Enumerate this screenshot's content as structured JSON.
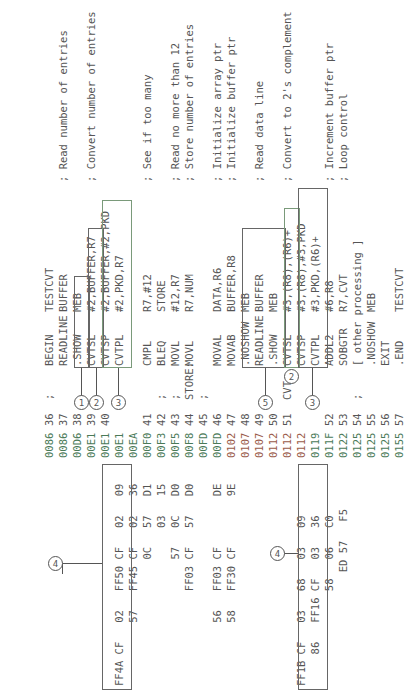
{
  "listing": [
    {
      "hex": "",
      "addr": "0086",
      "line": "36",
      "label": ";",
      "op": "BEGIN",
      "args": "TESTCVT",
      "comment": ""
    },
    {
      "hex": "",
      "addr": "0086",
      "line": "37",
      "label": "",
      "op": "READLINE",
      "args": "BUFFER",
      "comment": "; Read number of entries"
    },
    {
      "hex": "",
      "addr": "00D6",
      "line": "38",
      "label": "",
      "op": ".SHOW",
      "args": "MEB",
      "comment": ""
    },
    {
      "hex": "",
      "addr": "00E1",
      "line": "39",
      "label": "",
      "op": "CVTSL",
      "args": "#2,BUFFER,R7",
      "comment": "; Convert number of entries"
    },
    {
      "hex": "",
      "addr": "00E1",
      "line": "40",
      "label": "",
      "op": "CVTSP",
      "args": "#2,BUFFER,#2,PKD",
      "comment": ""
    },
    {
      "hex": "FF4A CF   02   FF50 CF   02   09",
      "addr": "00E1",
      "line": "",
      "label": "",
      "op": "CVTPL",
      "args": "#2,PKD,R7",
      "comment": ""
    },
    {
      "hex": "          57   FF45 CF   02   36",
      "addr": "00EA",
      "line": "",
      "label": "",
      "op": "",
      "args": "",
      "comment": ""
    },
    {
      "hex": "                    0C   57   D1",
      "addr": "00F0",
      "line": "41",
      "label": "",
      "op": "CMPL",
      "args": "R7,#12",
      "comment": "; See if too many"
    },
    {
      "hex": "                         03   15",
      "addr": "00F3",
      "line": "42",
      "label": ";",
      "op": "BLEQ",
      "args": "STORE",
      "comment": ""
    },
    {
      "hex": "                    57   0C   D0",
      "addr": "00F5",
      "line": "43",
      "label": ";",
      "op": "MOVL",
      "args": "#12,R7",
      "comment": "; Read no more than 12"
    },
    {
      "hex": "               FF03 CF   57   D0",
      "addr": "00F8",
      "line": "44",
      "label": "STORE:",
      "op": "MOVL",
      "args": "R7,NUM",
      "comment": "; Store number of entries"
    },
    {
      "hex": "",
      "addr": "00FD",
      "line": "45",
      "label": ";",
      "op": "",
      "args": "",
      "comment": ""
    },
    {
      "hex": "          56   FF03 CF        DE",
      "addr": "00FD",
      "line": "46",
      "label": "",
      "op": "MOVAL",
      "args": "DATA,R6",
      "comment": "; Initialize array ptr"
    },
    {
      "hex": "          58   FF30 CF        9E",
      "addr": "0102",
      "line": "47",
      "label": "",
      "op": "MOVAB",
      "args": "BUFFER,R8",
      "comment": "; Initialize buffer ptr"
    },
    {
      "hex": "",
      "addr": "0107",
      "line": "48",
      "label": "",
      "op": ".NOSHOW",
      "args": "MEB",
      "comment": ""
    },
    {
      "hex": "",
      "addr": "0107",
      "line": "49",
      "label": "",
      "op": "READLINE",
      "args": "BUFFER",
      "comment": "; Read data line"
    },
    {
      "hex": "",
      "addr": "0112",
      "line": "50",
      "label": "",
      "op": ".SHOW",
      "args": "MEB",
      "comment": ""
    },
    {
      "hex": "",
      "addr": "0112",
      "line": "51",
      "label": "CVT:",
      "op": "CVTSL",
      "args": "#3,(R8),(R6)+",
      "comment": "; Convert to 2's complement"
    },
    {
      "hex": "FF1B CF   03   68   03   09",
      "addr": "0112",
      "line": "",
      "label": "",
      "op": "CVTSP",
      "args": "#3,(R8),#3,PKD",
      "comment": ""
    },
    {
      "hex": "     86   FF16 CF   03   36",
      "addr": "0119",
      "line": "",
      "label": "",
      "op": "CVTPL",
      "args": "#3,PKD,(R6)+",
      "comment": ""
    },
    {
      "hex": "               58   06   C0",
      "addr": "011F",
      "line": "52",
      "label": "",
      "op": "ADDL2",
      "args": "#6,R8",
      "comment": "; Increment buffer ptr"
    },
    {
      "hex": "                  ED 57   F5",
      "addr": "0122",
      "line": "53",
      "label": "",
      "op": "SOBGTR",
      "args": "R7,CVT",
      "comment": "; Loop control"
    },
    {
      "hex": "",
      "addr": "0125",
      "line": "54",
      "label": ";",
      "op": "[ other processing ]",
      "args": "",
      "comment": ""
    },
    {
      "hex": "",
      "addr": "0125",
      "line": "55",
      "label": "",
      "op": ".NOSHOW",
      "args": "MEB",
      "comment": ""
    },
    {
      "hex": "",
      "addr": "0125",
      "line": "56",
      "label": "",
      "op": "EXIT",
      "args": "",
      "comment": ""
    },
    {
      "hex": "",
      "addr": "0155",
      "line": "57",
      "label": "",
      "op": ".END",
      "args": "TESTCVT",
      "comment": ""
    }
  ],
  "markers": {
    "m1": "1",
    "m2a": "2",
    "m3a": "3",
    "m4a": "4",
    "m5": "5",
    "m2b": "2",
    "m3b": "3",
    "m4b": "4"
  }
}
